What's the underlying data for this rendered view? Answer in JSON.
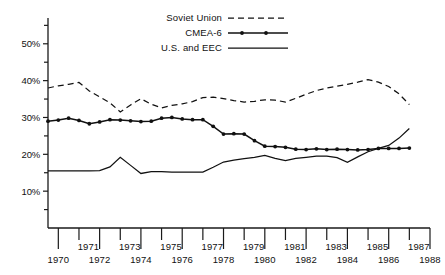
{
  "chart_data": {
    "type": "line",
    "title": "",
    "subtitle": "",
    "xlabel": "",
    "ylabel": "",
    "xlim": [
      1969.5,
      1988.0
    ],
    "ylim": [
      0,
      57
    ],
    "grid": false,
    "legend_position": "top-center",
    "y_tick_labels": [
      "10%",
      "20%",
      "30%",
      "40%",
      "50%"
    ],
    "y_ticks_major": [
      10,
      20,
      30,
      40,
      50
    ],
    "y_ticks_minor": [
      5,
      15,
      25,
      35,
      45,
      55
    ],
    "x_tick_labels_upper": [
      "1971",
      "1973",
      "1975",
      "1977",
      "1979",
      "1981",
      "1983",
      "1985",
      "1987"
    ],
    "x_tick_labels_lower": [
      "1970",
      "1972",
      "1974",
      "1976",
      "1978",
      "1980",
      "1982",
      "1984",
      "1986",
      "1988"
    ],
    "x_ticks": [
      1970,
      1971,
      1972,
      1973,
      1974,
      1975,
      1976,
      1977,
      1978,
      1979,
      1980,
      1981,
      1982,
      1983,
      1984,
      1985,
      1986,
      1987,
      1988
    ],
    "x": [
      1969.5,
      1970.0,
      1970.5,
      1971.0,
      1971.5,
      1972.0,
      1972.5,
      1973.0,
      1973.5,
      1974.0,
      1974.5,
      1975.0,
      1975.5,
      1976.0,
      1976.5,
      1977.0,
      1977.5,
      1978.0,
      1978.5,
      1979.0,
      1979.5,
      1980.0,
      1980.5,
      1981.0,
      1981.5,
      1982.0,
      1982.5,
      1983.0,
      1983.5,
      1984.0,
      1984.5,
      1985.0,
      1985.5,
      1986.0,
      1986.5,
      1987.0
    ],
    "series": [
      {
        "name": "Soviet Union",
        "style": "dashed",
        "markers": false,
        "color": "#111111",
        "values": [
          38.0,
          38.6,
          39.0,
          39.5,
          37.2,
          35.6,
          34.0,
          31.5,
          33.4,
          35.1,
          33.6,
          32.6,
          33.3,
          33.7,
          34.3,
          35.4,
          35.5,
          35.1,
          34.6,
          34.2,
          34.4,
          34.8,
          34.7,
          34.2,
          35.2,
          36.3,
          37.3,
          38.0,
          38.5,
          39.0,
          39.6,
          40.3,
          39.6,
          38.4,
          36.4,
          33.5
        ]
      },
      {
        "name": "CMEA-6",
        "style": "solid-markers",
        "markers": true,
        "color": "#111111",
        "values": [
          29.0,
          29.3,
          29.8,
          29.2,
          28.3,
          28.8,
          29.4,
          29.3,
          29.1,
          28.9,
          29.0,
          29.8,
          30.0,
          29.6,
          29.4,
          29.4,
          27.6,
          25.5,
          25.6,
          25.5,
          23.7,
          22.2,
          22.1,
          21.9,
          21.4,
          21.3,
          21.5,
          21.3,
          21.4,
          21.3,
          21.2,
          21.3,
          21.6,
          21.6,
          21.6,
          21.7
        ]
      },
      {
        "name": "U.S. and EEC",
        "style": "solid",
        "markers": false,
        "color": "#111111",
        "values": [
          15.5,
          15.5,
          15.5,
          15.5,
          15.5,
          15.6,
          16.6,
          19.2,
          17.0,
          14.8,
          15.3,
          15.3,
          15.2,
          15.2,
          15.2,
          15.2,
          16.5,
          17.9,
          18.4,
          18.8,
          19.2,
          19.7,
          18.9,
          18.3,
          18.9,
          19.2,
          19.5,
          19.5,
          19.1,
          17.8,
          19.3,
          20.7,
          21.6,
          22.4,
          24.4,
          27.0
        ]
      }
    ],
    "legend": [
      {
        "label": "Soviet Union",
        "style": "dashed"
      },
      {
        "label": "CMEA-6",
        "style": "solid-markers"
      },
      {
        "label": "U.S. and EEC",
        "style": "solid"
      }
    ]
  }
}
